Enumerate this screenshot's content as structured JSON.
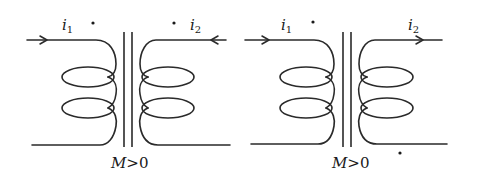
{
  "diagram": {
    "figures": [
      {
        "id": "left",
        "primary_current": {
          "symbol": "i",
          "subscript": "1",
          "direction": "into coil (arrow right)"
        },
        "secondary_current": {
          "symbol": "i",
          "subscript": "2",
          "direction": "into coil (arrow left)"
        },
        "dots": [
          "primary top terminal",
          "secondary top terminal"
        ],
        "condition": {
          "var": "M",
          "relation": ">",
          "value": "0"
        }
      },
      {
        "id": "right",
        "primary_current": {
          "symbol": "i",
          "subscript": "1",
          "direction": "into coil (arrow right)"
        },
        "secondary_current": {
          "symbol": "i",
          "subscript": "2",
          "direction": "out of coil (arrow right)"
        },
        "dots": [
          "primary top terminal",
          "secondary bottom terminal"
        ],
        "condition": {
          "var": "M",
          "relation": ">",
          "value": "0"
        }
      }
    ],
    "colors": {
      "ink": "#2a2a2a",
      "background": "#ffffff"
    }
  }
}
